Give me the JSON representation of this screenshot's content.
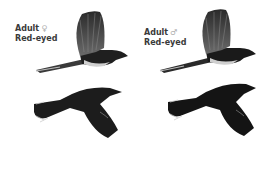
{
  "plates": [
    {
      "position": "left",
      "label_line1": "Adult",
      "sex_symbol": "♀",
      "label_line2": "Red-eyed",
      "figures": [
        "upperside-flight",
        "underside-flight"
      ]
    },
    {
      "position": "right",
      "label_line1": "Adult",
      "sex_symbol": "♂",
      "label_line2": "Red-eyed",
      "figures": [
        "upperside-flight",
        "underside-flight"
      ]
    }
  ],
  "colors": {
    "plumage_dark": "#1c1c1c",
    "wing_gray": "#555555",
    "flank_light": "#cfcfcf",
    "background": "#ffffff"
  }
}
